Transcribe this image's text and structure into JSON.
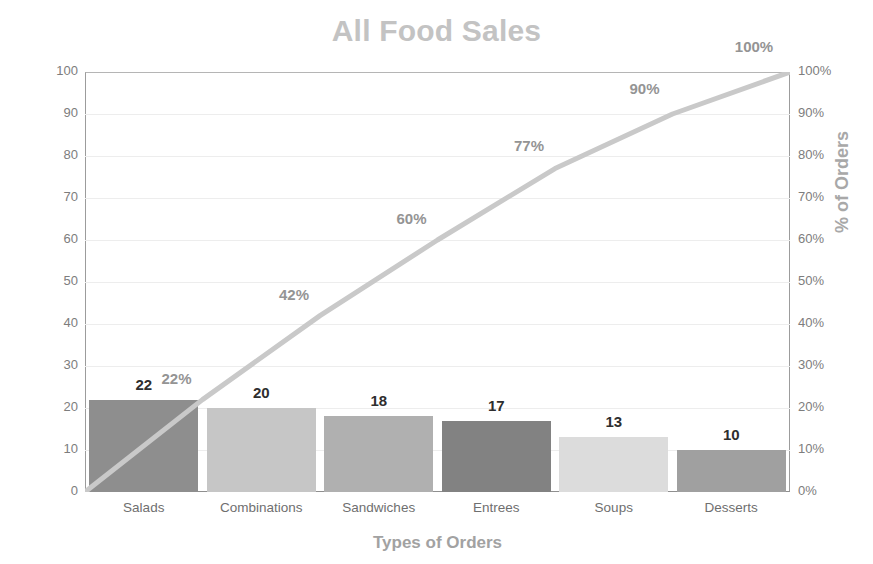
{
  "chart_data": {
    "type": "bar",
    "title": "All Food Sales",
    "xlabel": "Types of Orders",
    "ylabel": "Frequency of Orders",
    "y2label": "% of Orders",
    "categories": [
      "Salads",
      "Combinations",
      "Sandwiches",
      "Entrees",
      "Soups",
      "Desserts"
    ],
    "values": [
      22,
      20,
      18,
      17,
      13,
      10
    ],
    "value_labels": [
      "22",
      "20",
      "18",
      "17",
      "13",
      "10"
    ],
    "cumulative_percent": [
      22,
      42,
      60,
      77,
      90,
      100
    ],
    "cumulative_labels": [
      "22%",
      "42%",
      "60%",
      "77%",
      "90%",
      "100%"
    ],
    "ylim": [
      0,
      100
    ],
    "y2lim": [
      0,
      100
    ],
    "yticks": [
      0,
      10,
      20,
      30,
      40,
      50,
      60,
      70,
      80,
      90,
      100
    ],
    "ytick_labels": [
      "0",
      "10",
      "20",
      "30",
      "40",
      "50",
      "60",
      "70",
      "80",
      "90",
      "100"
    ],
    "y2tick_labels": [
      "0%",
      "10%",
      "20%",
      "30%",
      "40%",
      "50%",
      "60%",
      "70%",
      "80%",
      "90%",
      "100%"
    ],
    "grid": true,
    "legend": "none",
    "bar_colors": [
      "#8e8e8e",
      "#c6c6c6",
      "#b0b0b0",
      "#828282",
      "#dcdcdc",
      "#a0a0a0"
    ],
    "line_color": "#c9c9c9",
    "title_color": "#c3c3c3",
    "axis_label_color": "#a8a8a8",
    "tick_color": "#7d7d7d"
  }
}
